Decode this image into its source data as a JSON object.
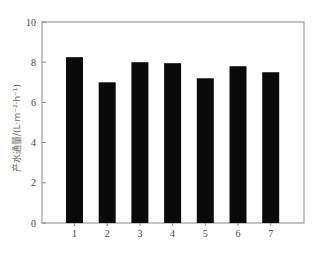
{
  "chart_data": {
    "type": "bar",
    "title": "",
    "xlabel": "",
    "ylabel": "产水通量/(L·m⁻²·h⁻¹)",
    "categories": [
      "1",
      "2",
      "3",
      "4",
      "5",
      "6",
      "7"
    ],
    "values": [
      8.25,
      7.0,
      8.0,
      7.95,
      7.2,
      7.8,
      7.5
    ],
    "ylim": [
      0,
      10
    ],
    "yticks": [
      "0",
      "2",
      "4",
      "6",
      "8",
      "10"
    ],
    "grid": false,
    "legend": null,
    "bar_color": "#0a0a0a"
  }
}
